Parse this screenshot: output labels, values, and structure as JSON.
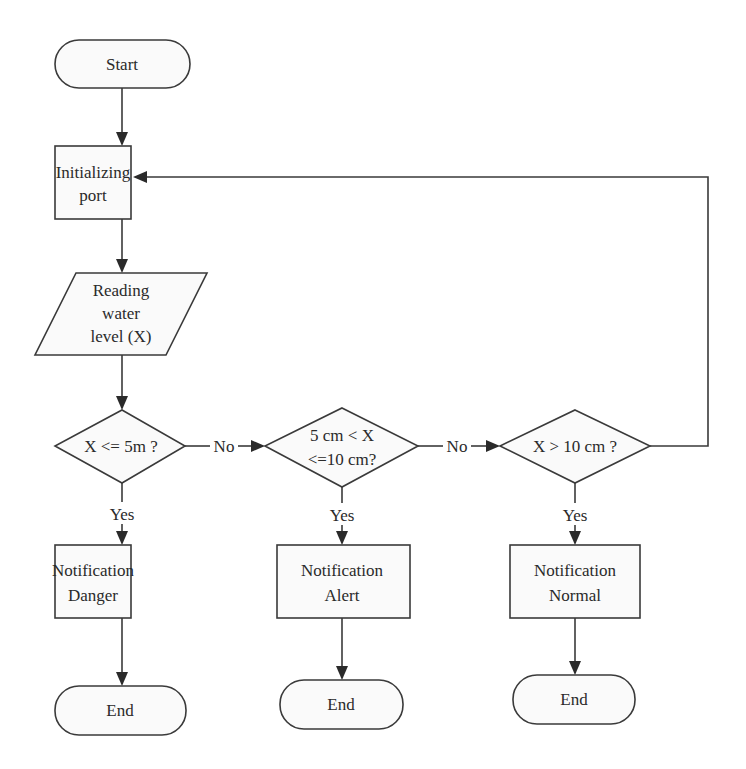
{
  "diagram": {
    "type": "flowchart",
    "nodes": {
      "start": {
        "shape": "terminator",
        "lines": [
          "Start"
        ]
      },
      "init": {
        "shape": "process",
        "lines": [
          "Initializing",
          "port"
        ]
      },
      "read": {
        "shape": "input-output",
        "lines": [
          "Reading",
          "water",
          "level (X)"
        ]
      },
      "decision1": {
        "shape": "decision",
        "lines": [
          "X <= 5m ?"
        ]
      },
      "decision2": {
        "shape": "decision",
        "lines": [
          "5 cm < X",
          "<=10 cm?"
        ]
      },
      "decision3": {
        "shape": "decision",
        "lines": [
          "X > 10 cm ?"
        ]
      },
      "notify_danger": {
        "shape": "process",
        "lines": [
          "Notification",
          "Danger"
        ]
      },
      "notify_alert": {
        "shape": "process",
        "lines": [
          "Notification",
          "Alert"
        ]
      },
      "notify_normal": {
        "shape": "process",
        "lines": [
          "Notification",
          "Normal"
        ]
      },
      "end1": {
        "shape": "terminator",
        "lines": [
          "End"
        ]
      },
      "end2": {
        "shape": "terminator",
        "lines": [
          "End"
        ]
      },
      "end3": {
        "shape": "terminator",
        "lines": [
          "End"
        ]
      }
    },
    "edge_labels": {
      "d1_no": "No",
      "d2_no": "No",
      "d1_yes": "Yes",
      "d2_yes": "Yes",
      "d3_yes": "Yes"
    },
    "edges": [
      {
        "from": "start",
        "to": "init"
      },
      {
        "from": "init",
        "to": "read"
      },
      {
        "from": "read",
        "to": "decision1"
      },
      {
        "from": "decision1",
        "to": "decision2",
        "label": "No"
      },
      {
        "from": "decision2",
        "to": "decision3",
        "label": "No"
      },
      {
        "from": "decision3",
        "to": "init",
        "label": ""
      },
      {
        "from": "decision1",
        "to": "notify_danger",
        "label": "Yes"
      },
      {
        "from": "decision2",
        "to": "notify_alert",
        "label": "Yes"
      },
      {
        "from": "decision3",
        "to": "notify_normal",
        "label": "Yes"
      },
      {
        "from": "notify_danger",
        "to": "end1"
      },
      {
        "from": "notify_alert",
        "to": "end2"
      },
      {
        "from": "notify_normal",
        "to": "end3"
      }
    ],
    "colors": {
      "stroke": "#3a3a3a",
      "fill": "#fafafa",
      "text": "#2a2a2a",
      "background": "#ffffff"
    }
  }
}
